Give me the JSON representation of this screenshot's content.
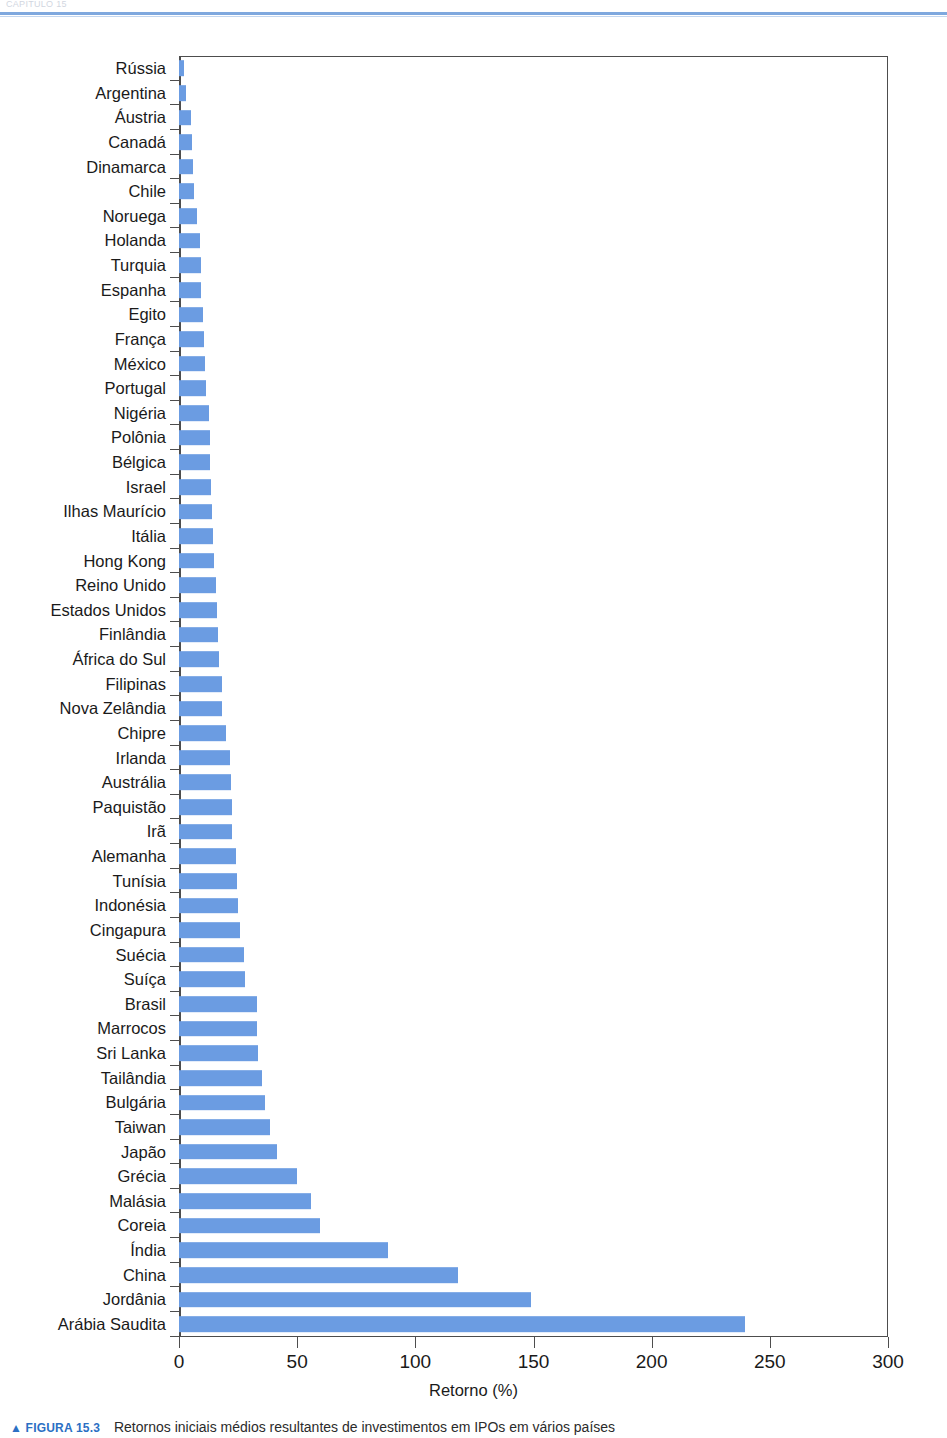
{
  "page": {
    "running_head": "CAPÍTULO 15",
    "rule_color": "#7fa8de"
  },
  "caption": {
    "marker": "▲ FIGURA 15.3",
    "text": "Retornos iniciais médios resultantes de investimentos em IPOs em vários países"
  },
  "chart_data": {
    "type": "bar",
    "orientation": "horizontal",
    "title": "",
    "xlabel": "Retorno (%)",
    "ylabel": "",
    "xlim": [
      0,
      300
    ],
    "xticks": [
      0,
      50,
      100,
      150,
      200,
      250,
      300
    ],
    "xtick_labels": [
      "0",
      "50",
      "100",
      "150",
      "200",
      "250",
      "300"
    ],
    "grid": false,
    "legend": null,
    "bar_color": "#6b9ce2",
    "categories": [
      "Rússia",
      "Argentina",
      "Áustria",
      "Canadá",
      "Dinamarca",
      "Chile",
      "Noruega",
      "Holanda",
      "Turquia",
      "Espanha",
      "Egito",
      "França",
      "México",
      "Portugal",
      "Nigéria",
      "Polônia",
      "Bélgica",
      "Israel",
      "Ilhas Maurício",
      "Itália",
      "Hong Kong",
      "Reino Unido",
      "Estados Unidos",
      "Finlândia",
      "África do Sul",
      "Filipinas",
      "Nova Zelândia",
      "Chipre",
      "Irlanda",
      "Austrália",
      "Paquistão",
      "Irã",
      "Alemanha",
      "Tunísia",
      "Indonésia",
      "Cingapura",
      "Suécia",
      "Suíça",
      "Brasil",
      "Marrocos",
      "Sri Lanka",
      "Tailândia",
      "Bulgária",
      "Taiwan",
      "Japão",
      "Grécia",
      "Malásia",
      "Coreia",
      "Índia",
      "China",
      "Jordânia",
      "Arábia Saudita"
    ],
    "values": [
      2.0,
      3.0,
      5.0,
      5.5,
      6.0,
      6.5,
      7.5,
      9.0,
      9.5,
      9.5,
      10.0,
      10.5,
      11.0,
      11.5,
      12.5,
      13.0,
      13.0,
      13.5,
      14.0,
      14.5,
      15.0,
      15.5,
      16.0,
      16.5,
      17.0,
      18.0,
      18.0,
      20.0,
      21.5,
      22.0,
      22.5,
      22.5,
      24.0,
      24.5,
      25.0,
      26.0,
      27.5,
      28.0,
      33.0,
      33.0,
      33.5,
      35.0,
      36.5,
      38.5,
      41.5,
      50.0,
      56.0,
      59.5,
      88.5,
      118.0,
      149.0,
      239.5
    ]
  }
}
